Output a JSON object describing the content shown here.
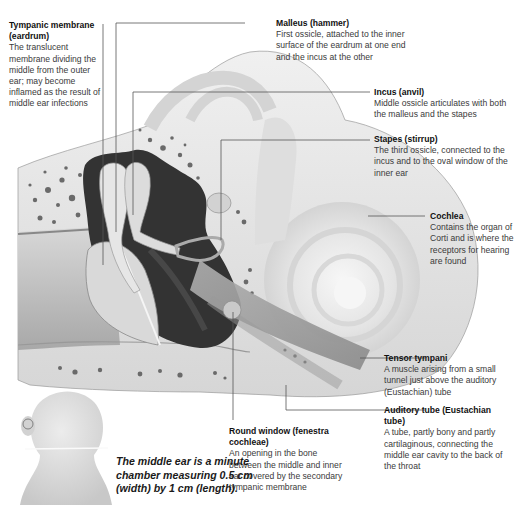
{
  "diagram": {
    "colors": {
      "background": "#ffffff",
      "bone": "#e2e2e2",
      "cavity": "#2a2a2a",
      "leader_line": "#555555",
      "text": "#3a3a3a",
      "title_text": "#111111"
    }
  },
  "labels": [
    {
      "id": "tympanic",
      "title": "Tympanic membrane (eardrum)",
      "desc": "The translucent membrane dividing the middle from the outer ear; may become inflamed as the result of middle ear infections"
    },
    {
      "id": "malleus",
      "title": "Malleus (hammer)",
      "desc": "First ossicle, attached to the inner surface of the eardrum at one end and the incus at the other"
    },
    {
      "id": "incus",
      "title": "Incus (anvil)",
      "desc": "Middle ossicle articulates with both the malleus and the stapes"
    },
    {
      "id": "stapes",
      "title": "Stapes (stirrup)",
      "desc": "The third ossicle, connected to the incus and to the oval window of the inner ear"
    },
    {
      "id": "cochlea",
      "title": "Cochlea",
      "desc": "Contains the organ of Corti and is where the receptors for hearing are found"
    },
    {
      "id": "tensor",
      "title": "Tensor tympani",
      "desc": "A muscle arising from a small tunnel just above the auditory (Eustachian) tube"
    },
    {
      "id": "auditory",
      "title": "Auditory tube (Eustachian tube)",
      "desc": "A tube, partly bony and partly cartilaginous, connecting the middle ear cavity to the back of the throat"
    },
    {
      "id": "round",
      "title": "Round window (fenestra cochleae)",
      "desc": "An opening in the bone between the middle and inner ear covered by the secondary tympanic membrane"
    }
  ],
  "caption": "The middle ear is a minute chamber measuring 0.5 cm (width) by 1 cm (length).",
  "icons": {
    "head": "head-back-view-icon",
    "ear_marker": "circle-marker-icon"
  }
}
